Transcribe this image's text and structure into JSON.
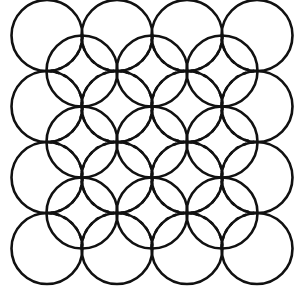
{
  "diagram": {
    "stroke_color": "#111111",
    "background": "#ffffff",
    "radius": 35.5,
    "outer_grid": {
      "rows": 4,
      "cols": 4,
      "x0": 47,
      "y0": 35.5,
      "dx": 70,
      "dy": 71
    },
    "inner_grid": {
      "rows": 3,
      "cols": 3,
      "x0": 82,
      "y0": 71,
      "dx": 70,
      "dy": 71
    },
    "dashed_style": "4,4"
  }
}
